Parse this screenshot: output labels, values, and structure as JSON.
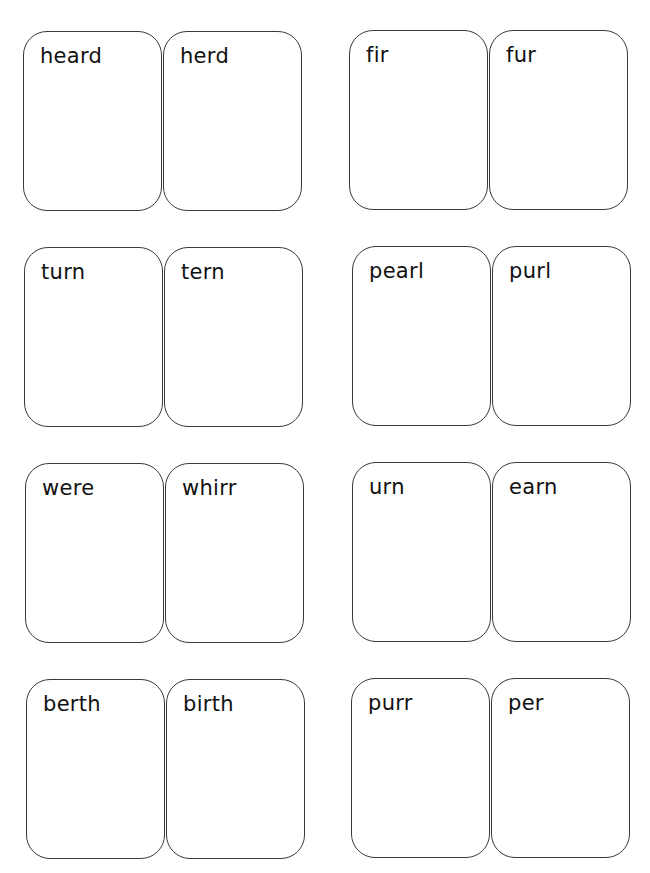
{
  "page": {
    "background": "#ffffff",
    "border_color": "#3a3a3a",
    "text_color": "#111111"
  },
  "pairs": [
    {
      "row": 1,
      "column": "left",
      "cards": [
        {
          "word": "heard"
        },
        {
          "word": "herd"
        }
      ]
    },
    {
      "row": 1,
      "column": "right",
      "cards": [
        {
          "word": "fir"
        },
        {
          "word": "fur"
        }
      ]
    },
    {
      "row": 2,
      "column": "left",
      "cards": [
        {
          "word": "turn"
        },
        {
          "word": "tern"
        }
      ]
    },
    {
      "row": 2,
      "column": "right",
      "cards": [
        {
          "word": "pearl"
        },
        {
          "word": "purl"
        }
      ]
    },
    {
      "row": 3,
      "column": "left",
      "cards": [
        {
          "word": "were"
        },
        {
          "word": "whirr"
        }
      ]
    },
    {
      "row": 3,
      "column": "right",
      "cards": [
        {
          "word": "urn"
        },
        {
          "word": "earn"
        }
      ]
    },
    {
      "row": 4,
      "column": "left",
      "cards": [
        {
          "word": "berth"
        },
        {
          "word": "birth"
        }
      ]
    },
    {
      "row": 4,
      "column": "right",
      "cards": [
        {
          "word": "purr"
        },
        {
          "word": "per"
        }
      ]
    }
  ]
}
